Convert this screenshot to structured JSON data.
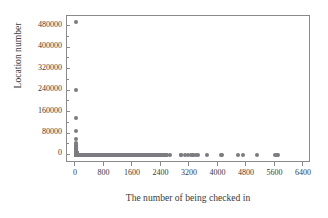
{
  "chart_data": {
    "type": "scatter",
    "title": "Distribution of being checked in for location",
    "xlabel": "The number of being checked in",
    "ylabel": "Location number",
    "xlim": [
      -250,
      6600
    ],
    "ylim": [
      -28000,
      520000
    ],
    "xticks": [
      0,
      800,
      1600,
      2400,
      3200,
      4000,
      4800,
      5600,
      6400
    ],
    "xticklabels": [
      "0",
      "800",
      "1600",
      "2400",
      "3200",
      "4000",
      "4800",
      "5600",
      "6400"
    ],
    "yticks": [
      0,
      80000,
      160000,
      240000,
      320000,
      400000,
      480000
    ],
    "yticklabels": [
      "0",
      "80000",
      "160000",
      "240000",
      "320000",
      "400000",
      "480000"
    ],
    "grid": false,
    "legend": null,
    "marker_color": "#7b7b80",
    "marker_size": 4,
    "frame_color": "#8a8a8a",
    "background": "#ffffff",
    "points": [
      [
        1,
        496000
      ],
      [
        2,
        245000
      ],
      [
        3,
        140000
      ],
      [
        4,
        90000
      ],
      [
        5,
        60000
      ],
      [
        6,
        46000
      ],
      [
        7,
        38000
      ],
      [
        8,
        31000
      ],
      [
        9,
        26000
      ],
      [
        10,
        22000
      ],
      [
        12,
        18000
      ],
      [
        14,
        15000
      ],
      [
        16,
        12500
      ],
      [
        18,
        10500
      ],
      [
        20,
        9000
      ],
      [
        24,
        7600
      ],
      [
        28,
        6400
      ],
      [
        32,
        5500
      ],
      [
        38,
        4600
      ],
      [
        44,
        3900
      ],
      [
        50,
        3300
      ],
      [
        58,
        2800
      ],
      [
        66,
        2400
      ],
      [
        76,
        2000
      ],
      [
        88,
        1700
      ],
      [
        100,
        1450
      ],
      [
        115,
        1220
      ],
      [
        132,
        1030
      ],
      [
        150,
        880
      ],
      [
        172,
        740
      ],
      [
        196,
        630
      ],
      [
        224,
        530
      ],
      [
        256,
        450
      ],
      [
        292,
        380
      ],
      [
        332,
        320
      ],
      [
        378,
        270
      ],
      [
        430,
        230
      ],
      [
        488,
        195
      ],
      [
        554,
        165
      ],
      [
        628,
        140
      ],
      [
        712,
        118
      ],
      [
        806,
        100
      ],
      [
        912,
        85
      ],
      [
        1030,
        72
      ],
      [
        1162,
        61
      ],
      [
        1310,
        52
      ],
      [
        1476,
        44
      ],
      [
        1660,
        37
      ],
      [
        1866,
        31
      ],
      [
        2094,
        26
      ],
      [
        2348,
        22
      ],
      [
        2630,
        19
      ],
      [
        2944,
        16
      ],
      [
        3290,
        13
      ],
      [
        3672,
        11
      ],
      [
        4094,
        9
      ],
      [
        4560,
        7
      ],
      [
        5074,
        6
      ],
      [
        5640,
        5
      ],
      [
        1440,
        35
      ],
      [
        1520,
        33
      ],
      [
        1580,
        30
      ],
      [
        1700,
        28
      ],
      [
        1790,
        25
      ],
      [
        1880,
        23
      ],
      [
        1960,
        21
      ],
      [
        2040,
        19
      ],
      [
        2140,
        17
      ],
      [
        2280,
        15
      ],
      [
        2420,
        13
      ],
      [
        2960,
        12
      ],
      [
        3060,
        11
      ],
      [
        3160,
        10
      ],
      [
        3240,
        10
      ],
      [
        3300,
        9
      ],
      [
        3360,
        9
      ],
      [
        3420,
        8
      ],
      [
        4080,
        6
      ],
      [
        4700,
        5
      ],
      [
        5580,
        4
      ],
      [
        5680,
        4
      ]
    ]
  }
}
